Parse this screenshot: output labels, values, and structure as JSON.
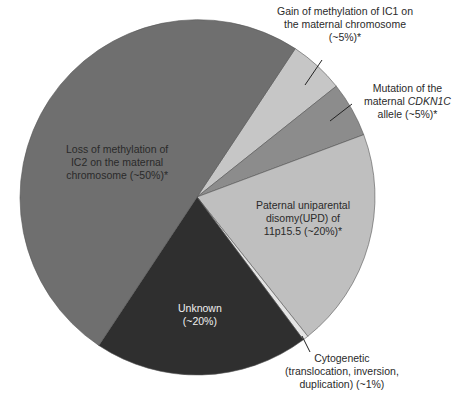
{
  "chart_data": {
    "type": "pie",
    "title": "",
    "center": [
      197,
      197
    ],
    "radius": 178,
    "start_angle_deg": 33.5,
    "direction": "clockwise",
    "slices": [
      {
        "key": "gain_ic1",
        "label": "Gain of methylation of IC1 on the maternal chromosome (~5%)*",
        "value": 5,
        "display_percent": "~5%",
        "color": "#c6c6c6"
      },
      {
        "key": "mutation_cdkn1c",
        "label": "Mutation of the maternal CDKN1C allele (~5%)*",
        "value": 5,
        "display_percent": "~5%",
        "color": "#8c8c8c"
      },
      {
        "key": "paternal_upd",
        "label": "Paternal uniparental disomy(UPD) of 11p15.5 (~20%)*",
        "value": 20,
        "display_percent": "~20%",
        "color": "#bfbfbf"
      },
      {
        "key": "cytogenetic",
        "label": "Cytogenetic (translocation, inversion, duplication) (~1%)",
        "value": 0.5,
        "display_percent": "~1%",
        "color": "#e4e4e4"
      },
      {
        "key": "unknown",
        "label": "Unknown (~20%)",
        "value": 19.5,
        "display_percent": "~20%",
        "color": "#2f2f2f"
      },
      {
        "key": "loss_ic2",
        "label": "Loss of methylation of IC2 on the maternal chromosome (~50%)*",
        "value": 50,
        "display_percent": "~50%",
        "color": "#6f6f6f"
      }
    ],
    "legend": null,
    "annotations": [
      "Gain of methylation of IC1 on the maternal chromosome (~5%)*",
      "Mutation of the maternal CDKN1C allele (~5%)*",
      "Paternal uniparental disomy(UPD) of 11p15.5 (~20%)*",
      "Cytogenetic (translocation, inversion, duplication) (~1%)",
      "Unknown (~20%)",
      "Loss of methylation of IC2 on the maternal chromosome (~50%)*"
    ]
  },
  "labels": {
    "gain": {
      "line1": "Gain of methylation of IC1 on",
      "line2": "the maternal chromosome",
      "line3": "(~5%)*"
    },
    "mutation": {
      "line1": "Mutation of the",
      "line2_pre": "maternal ",
      "line2_italic": "CDKN1C",
      "line3": "allele (~5%)*"
    },
    "loss": {
      "line1": "Loss of methylation of",
      "line2": "IC2 on the maternal",
      "line3": "chromosome (~50%)*"
    },
    "paternal": {
      "line1": "Paternal uniparental",
      "line2": "disomy(UPD) of",
      "line3": "11p15.5 (~20%)*"
    },
    "unknown": {
      "line1": "Unknown",
      "line2": "(~20%)"
    },
    "cytogenetic": {
      "line1": "Cytogenetic",
      "line2": "(translocation, inversion,",
      "line3": "duplication) (~1%)"
    }
  },
  "leaders": [
    {
      "key": "gain",
      "x1": 322,
      "y1": 60,
      "x2": 305,
      "y2": 85
    },
    {
      "key": "mutation",
      "x1": 352,
      "y1": 104,
      "x2": 330,
      "y2": 121
    },
    {
      "key": "cytogenetic",
      "x1": 302,
      "y1": 336,
      "x2": 310,
      "y2": 352
    }
  ]
}
